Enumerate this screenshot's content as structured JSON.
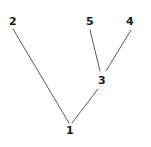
{
  "diagram": {
    "type": "tree-graph",
    "background_color": "#ffffff",
    "edge_color": "#59595f",
    "label_color": "#1a1a1a",
    "width": 151,
    "height": 147,
    "nodes": [
      {
        "id": "1",
        "label": "1",
        "x": 70,
        "y": 131,
        "role": "root-node"
      },
      {
        "id": "2",
        "label": "2",
        "x": 13,
        "y": 22,
        "role": "leaf-node"
      },
      {
        "id": "3",
        "label": "3",
        "x": 102,
        "y": 81,
        "role": "internal-node"
      },
      {
        "id": "4",
        "label": "4",
        "x": 130,
        "y": 22,
        "role": "leaf-node"
      },
      {
        "id": "5",
        "label": "5",
        "x": 90,
        "y": 22,
        "role": "leaf-node"
      }
    ],
    "edges": [
      {
        "from": "2",
        "to": "1",
        "x1": 13,
        "y1": 29,
        "x2": 69,
        "y2": 123
      },
      {
        "from": "5",
        "to": "3",
        "x1": 90,
        "y1": 30,
        "x2": 100,
        "y2": 71
      },
      {
        "from": "4",
        "to": "3",
        "x1": 131,
        "y1": 30,
        "x2": 106,
        "y2": 71
      },
      {
        "from": "3",
        "to": "1",
        "x1": 98,
        "y1": 89,
        "x2": 72,
        "y2": 123
      }
    ]
  }
}
